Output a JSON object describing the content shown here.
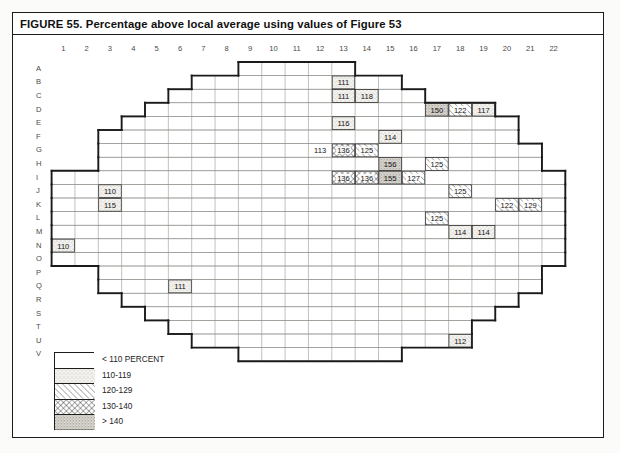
{
  "figure": {
    "title": "FIGURE 55. Percentage above local average using values of Figure 53"
  },
  "axes": {
    "columns": [
      "1",
      "2",
      "3",
      "4",
      "5",
      "6",
      "7",
      "8",
      "9",
      "10",
      "11",
      "12",
      "13",
      "14",
      "15",
      "16",
      "17",
      "18",
      "19",
      "20",
      "21",
      "22"
    ],
    "rows": [
      "A",
      "B",
      "C",
      "D",
      "E",
      "F",
      "G",
      "H",
      "I",
      "J",
      "K",
      "L",
      "M",
      "N",
      "O",
      "P",
      "Q",
      "R",
      "S",
      "T",
      "U",
      "V"
    ]
  },
  "legend": {
    "title": "",
    "items": [
      {
        "label": "< 110 PERCENT",
        "pattern": "blank",
        "range": [
          null,
          110
        ]
      },
      {
        "label": "110-119",
        "pattern": "light-stipple",
        "range": [
          110,
          119
        ]
      },
      {
        "label": "120-129",
        "pattern": "diagonal-hatch",
        "range": [
          120,
          129
        ]
      },
      {
        "label": "130-140",
        "pattern": "cross-hatch",
        "range": [
          130,
          140
        ]
      },
      {
        "label": "> 140",
        "pattern": "dense-stipple",
        "range": [
          140,
          null
        ]
      }
    ]
  },
  "chart_data": {
    "type": "heatmap",
    "title": "FIGURE 55. Percentage above local average using values of Figure 53",
    "xlabel": "",
    "ylabel": "",
    "grid": true,
    "x": [
      "1",
      "2",
      "3",
      "4",
      "5",
      "6",
      "7",
      "8",
      "9",
      "10",
      "11",
      "12",
      "13",
      "14",
      "15",
      "16",
      "17",
      "18",
      "19",
      "20",
      "21",
      "22"
    ],
    "y": [
      "A",
      "B",
      "C",
      "D",
      "E",
      "F",
      "G",
      "H",
      "I",
      "J",
      "K",
      "L",
      "M",
      "N",
      "O",
      "P",
      "Q",
      "R",
      "S",
      "T",
      "U",
      "V"
    ],
    "legend_position": "bottom-left",
    "note": "Cells with no label are < 110 percent (blank). Only labelled cells carry values.",
    "cells": [
      {
        "row": "B",
        "col": 13,
        "value": 111,
        "pattern": "light-stipple"
      },
      {
        "row": "C",
        "col": 13,
        "value": 111,
        "pattern": "light-stipple"
      },
      {
        "row": "C",
        "col": 14,
        "value": 118,
        "pattern": "light-stipple"
      },
      {
        "row": "D",
        "col": 17,
        "value": 150,
        "pattern": "dense-stipple"
      },
      {
        "row": "D",
        "col": 18,
        "value": 122,
        "pattern": "diagonal-hatch"
      },
      {
        "row": "D",
        "col": 19,
        "value": 117,
        "pattern": "light-stipple"
      },
      {
        "row": "E",
        "col": 13,
        "value": 116,
        "pattern": "light-stipple"
      },
      {
        "row": "F",
        "col": 15,
        "value": 114,
        "pattern": "light-stipple"
      },
      {
        "row": "G",
        "col": 12,
        "value": 113,
        "pattern": "blank"
      },
      {
        "row": "G",
        "col": 13,
        "value": 136,
        "pattern": "cross-hatch"
      },
      {
        "row": "G",
        "col": 14,
        "value": 125,
        "pattern": "diagonal-hatch"
      },
      {
        "row": "H",
        "col": 15,
        "value": 156,
        "pattern": "dense-stipple"
      },
      {
        "row": "H",
        "col": 17,
        "value": 125,
        "pattern": "diagonal-hatch"
      },
      {
        "row": "I",
        "col": 13,
        "value": 136,
        "pattern": "cross-hatch"
      },
      {
        "row": "I",
        "col": 14,
        "value": 136,
        "pattern": "cross-hatch"
      },
      {
        "row": "I",
        "col": 15,
        "value": 155,
        "pattern": "dense-stipple"
      },
      {
        "row": "I",
        "col": 16,
        "value": 127,
        "pattern": "diagonal-hatch"
      },
      {
        "row": "J",
        "col": 3,
        "value": 110,
        "pattern": "light-stipple"
      },
      {
        "row": "J",
        "col": 18,
        "value": 125,
        "pattern": "diagonal-hatch"
      },
      {
        "row": "K",
        "col": 3,
        "value": 115,
        "pattern": "light-stipple"
      },
      {
        "row": "K",
        "col": 20,
        "value": 122,
        "pattern": "diagonal-hatch"
      },
      {
        "row": "K",
        "col": 21,
        "value": 129,
        "pattern": "diagonal-hatch"
      },
      {
        "row": "L",
        "col": 17,
        "value": 125,
        "pattern": "diagonal-hatch"
      },
      {
        "row": "M",
        "col": 18,
        "value": 114,
        "pattern": "light-stipple"
      },
      {
        "row": "M",
        "col": 19,
        "value": 114,
        "pattern": "light-stipple"
      },
      {
        "row": "N",
        "col": 1,
        "value": 110,
        "pattern": "light-stipple"
      },
      {
        "row": "Q",
        "col": 6,
        "value": 111,
        "pattern": "light-stipple"
      },
      {
        "row": "U",
        "col": 18,
        "value": 112,
        "pattern": "light-stipple"
      }
    ],
    "outline_row_extent": {
      "A": [
        9,
        13
      ],
      "B": [
        7,
        15
      ],
      "C": [
        6,
        16
      ],
      "D": [
        5,
        19
      ],
      "E": [
        4,
        20
      ],
      "F": [
        3,
        20
      ],
      "G": [
        3,
        21
      ],
      "H": [
        3,
        21
      ],
      "I": [
        1,
        22
      ],
      "J": [
        1,
        22
      ],
      "K": [
        1,
        22
      ],
      "L": [
        1,
        22
      ],
      "M": [
        1,
        22
      ],
      "N": [
        1,
        22
      ],
      "O": [
        1,
        22
      ],
      "P": [
        3,
        21
      ],
      "Q": [
        3,
        21
      ],
      "R": [
        4,
        20
      ],
      "S": [
        5,
        19
      ],
      "T": [
        6,
        18
      ],
      "U": [
        7,
        18
      ],
      "V": [
        9,
        15
      ]
    }
  }
}
